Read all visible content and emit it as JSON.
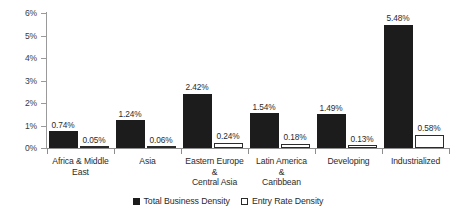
{
  "chart_data": {
    "type": "bar",
    "title": "",
    "xlabel": "",
    "ylabel": "",
    "ylim": [
      0,
      6
    ],
    "ytick_labels": [
      "0%",
      "1%",
      "2%",
      "3%",
      "4%",
      "5%",
      "6%"
    ],
    "ytick_values": [
      0,
      1,
      2,
      3,
      4,
      5,
      6
    ],
    "grid": false,
    "legend_position": "bottom-center",
    "categories": [
      "Africa & Middle East",
      "Asia",
      "Eastern Europe & Central Asia",
      "Latin America & Caribbean",
      "Developing",
      "Industrialized"
    ],
    "category_caption_lines": [
      [
        "Africa & Middle",
        "East"
      ],
      [
        "Asia"
      ],
      [
        "Eastern Europe",
        "&",
        "Central Asia"
      ],
      [
        "Latin America",
        "&",
        "Caribbean"
      ],
      [
        "Developing"
      ],
      [
        "Industrialized"
      ]
    ],
    "series": [
      {
        "name": "Total Business Density",
        "color": "#1c1c1c",
        "style": "filled",
        "values": [
          0.74,
          1.24,
          2.42,
          1.54,
          1.49,
          5.48
        ],
        "labels": [
          "0.74%",
          "1.24%",
          "2.42%",
          "1.54%",
          "1.49%",
          "5.48%"
        ]
      },
      {
        "name": "Entry Rate Density",
        "color": "#ffffff",
        "style": "hollow",
        "values": [
          0.05,
          0.06,
          0.24,
          0.18,
          0.13,
          0.58
        ],
        "labels": [
          "0.05%",
          "0.06%",
          "0.24%",
          "0.18%",
          "0.13%",
          "0.58%"
        ]
      }
    ]
  },
  "legend": {
    "items": [
      {
        "label": "Total Business Density"
      },
      {
        "label": "Entry Rate Density"
      }
    ]
  }
}
